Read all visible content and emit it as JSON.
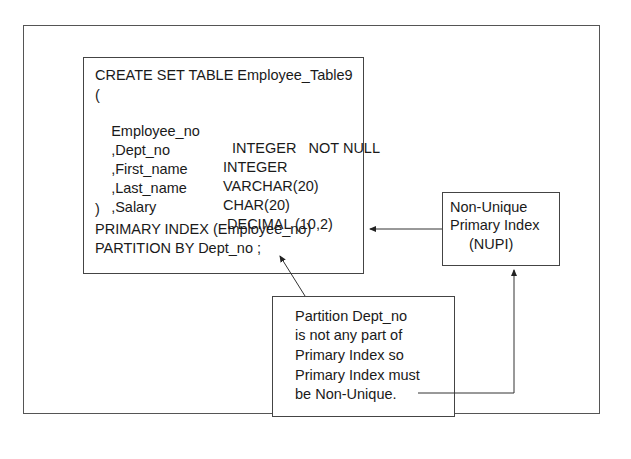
{
  "diagram": {
    "code_box": {
      "header": "CREATE SET TABLE Employee_Table9",
      "open_paren": "(",
      "columns": [
        {
          "name": "Employee_no",
          "type": "INTEGER   NOT NULL"
        },
        {
          "name": ",Dept_no",
          "type": "INTEGER"
        },
        {
          "name": ",First_name",
          "type": "VARCHAR(20)"
        },
        {
          "name": ",Last_name",
          "type": "CHAR(20)"
        },
        {
          "name": ",Salary",
          "type": "DECIMAL (10,2)"
        }
      ],
      "close_paren": ")",
      "primary_index": "PRIMARY INDEX (Employee_no)",
      "partition": "PARTITION BY Dept_no ;"
    },
    "nupi_box": {
      "lines": [
        "Non-Unique",
        "Primary Index",
        "(NUPI)"
      ]
    },
    "note_box": {
      "lines": [
        "Partition Dept_no",
        "is not any part of",
        "Primary Index so",
        "Primary Index must",
        "be Non-Unique."
      ]
    },
    "colors": {
      "line": "#333333",
      "text": "#1a1a1a",
      "background": "#ffffff"
    }
  }
}
